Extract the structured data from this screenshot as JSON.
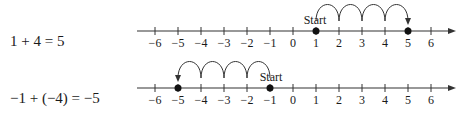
{
  "rows": [
    {
      "equation": "1 + 4 = 5",
      "number_line": {
        "ticks": [
          -6,
          -5,
          -4,
          -3,
          -2,
          -1,
          0,
          1,
          2,
          3,
          4,
          5,
          6
        ],
        "tick_labels": [
          "−6",
          "−5",
          "−4",
          "−3",
          "−2",
          "−1",
          "0",
          "1",
          "2",
          "3",
          "4",
          "5",
          "6"
        ],
        "start": 1,
        "end": 5,
        "start_label": "Start",
        "hops": [
          [
            1,
            2
          ],
          [
            2,
            3
          ],
          [
            3,
            4
          ],
          [
            4,
            5
          ]
        ],
        "direction": "right"
      }
    },
    {
      "equation": "−1 + (−4) = −5",
      "number_line": {
        "ticks": [
          -6,
          -5,
          -4,
          -3,
          -2,
          -1,
          0,
          1,
          2,
          3,
          4,
          5,
          6
        ],
        "tick_labels": [
          "−6",
          "−5",
          "−4",
          "−3",
          "−2",
          "−1",
          "0",
          "1",
          "2",
          "3",
          "4",
          "5",
          "6"
        ],
        "start": -1,
        "end": -5,
        "start_label": "Start",
        "hops": [
          [
            -1,
            -2
          ],
          [
            -2,
            -3
          ],
          [
            -3,
            -4
          ],
          [
            -4,
            -5
          ]
        ],
        "direction": "left"
      }
    }
  ]
}
